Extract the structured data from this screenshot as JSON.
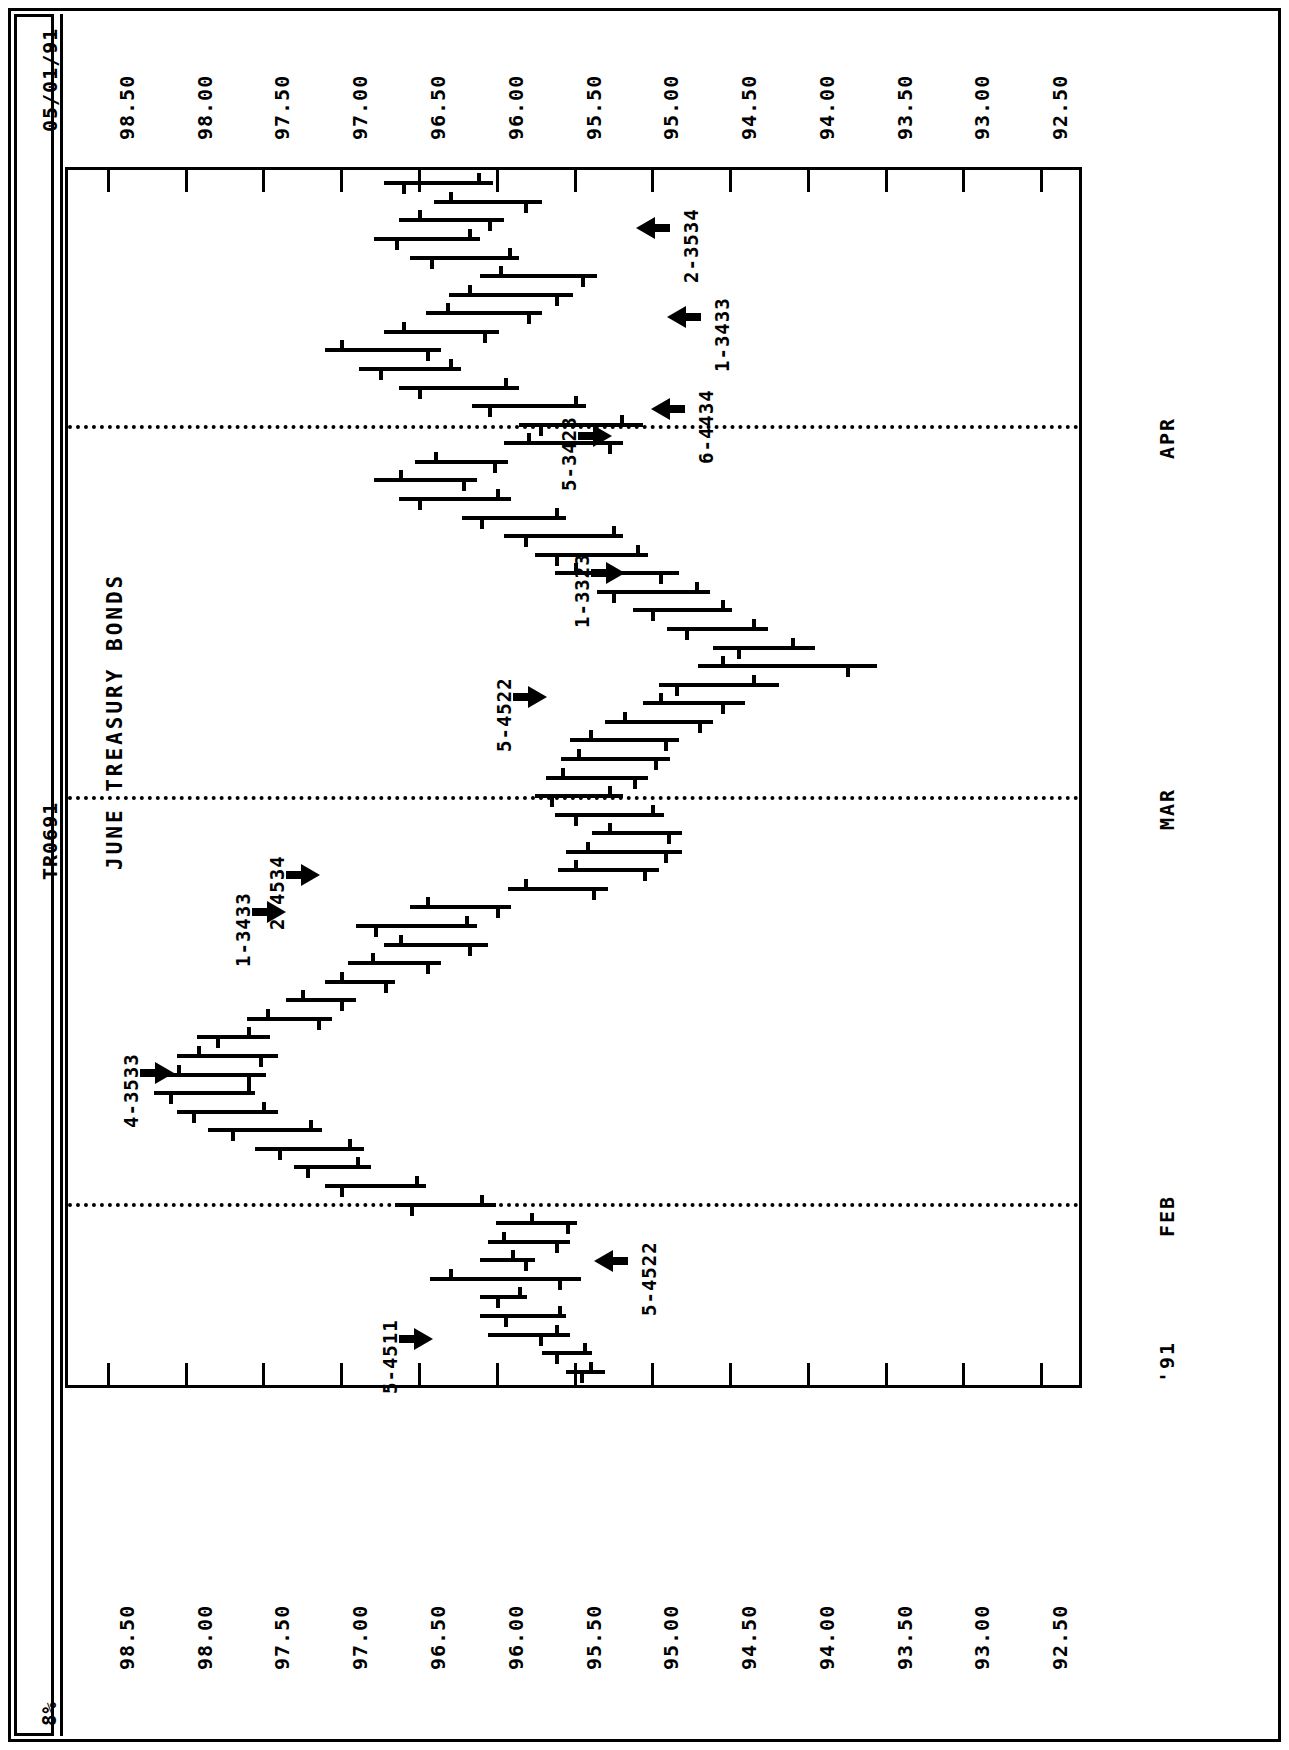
{
  "header": {
    "report_date": "05/01/91",
    "report_id": "TR0691",
    "page_mark": "8%"
  },
  "chart_data": {
    "type": "bar",
    "subtype": "ohlc-bar-chart-rotated",
    "title": "JUNE TREASURY BONDS",
    "xlabel": "",
    "ylabel": "",
    "orientation": "rotated-90-landscape",
    "value_axis": {
      "ticks": [
        "98.50",
        "98.00",
        "97.50",
        "97.00",
        "96.50",
        "96.00",
        "95.50",
        "95.00",
        "94.50",
        "94.00",
        "93.50",
        "93.00",
        "92.50"
      ],
      "min": 92.25,
      "max": 98.75,
      "duplicated_on": [
        "top",
        "bottom"
      ]
    },
    "time_axis": {
      "labels": [
        "'91",
        "FEB",
        "MAR",
        "APR"
      ],
      "label_positions_pct": [
        1.5,
        15.0,
        48.5,
        79.0
      ],
      "grid": "dotted-separators"
    },
    "bars": [
      {
        "i": 0,
        "high": 95.55,
        "low": 95.3,
        "open": 95.4,
        "close": 95.46
      },
      {
        "i": 1,
        "high": 95.7,
        "low": 95.38,
        "open": 95.44,
        "close": 95.62
      },
      {
        "i": 2,
        "high": 96.05,
        "low": 95.52,
        "open": 95.62,
        "close": 95.72
      },
      {
        "i": 3,
        "high": 96.1,
        "low": 95.55,
        "open": 95.6,
        "close": 95.95
      },
      {
        "i": 4,
        "high": 96.1,
        "low": 95.8,
        "open": 95.86,
        "close": 96.0
      },
      {
        "i": 5,
        "high": 96.42,
        "low": 95.45,
        "open": 96.3,
        "close": 95.6
      },
      {
        "i": 6,
        "high": 96.1,
        "low": 95.75,
        "open": 95.9,
        "close": 95.82
      },
      {
        "i": 7,
        "high": 96.05,
        "low": 95.52,
        "open": 95.96,
        "close": 95.62
      },
      {
        "i": 8,
        "high": 96.0,
        "low": 95.48,
        "open": 95.78,
        "close": 95.55
      },
      {
        "i": 9,
        "high": 96.65,
        "low": 96.0,
        "open": 96.1,
        "close": 96.55
      },
      {
        "i": 10,
        "high": 97.1,
        "low": 96.45,
        "open": 96.52,
        "close": 97.0
      },
      {
        "i": 11,
        "high": 97.3,
        "low": 96.8,
        "open": 96.9,
        "close": 97.22
      },
      {
        "i": 12,
        "high": 97.55,
        "low": 96.85,
        "open": 96.95,
        "close": 97.4
      },
      {
        "i": 13,
        "high": 97.85,
        "low": 97.12,
        "open": 97.2,
        "close": 97.7
      },
      {
        "i": 14,
        "high": 98.05,
        "low": 97.4,
        "open": 97.5,
        "close": 97.95
      },
      {
        "i": 15,
        "high": 98.2,
        "low": 97.55,
        "open": 97.6,
        "close": 98.1
      },
      {
        "i": 16,
        "high": 98.2,
        "low": 97.48,
        "open": 98.05,
        "close": 97.6
      },
      {
        "i": 17,
        "high": 98.05,
        "low": 97.4,
        "open": 97.92,
        "close": 97.52
      },
      {
        "i": 18,
        "high": 97.92,
        "low": 97.45,
        "open": 97.6,
        "close": 97.8
      },
      {
        "i": 19,
        "high": 97.6,
        "low": 97.05,
        "open": 97.48,
        "close": 97.15
      },
      {
        "i": 20,
        "high": 97.35,
        "low": 96.9,
        "open": 97.25,
        "close": 97.0
      },
      {
        "i": 21,
        "high": 97.1,
        "low": 96.65,
        "open": 97.0,
        "close": 96.72
      },
      {
        "i": 22,
        "high": 96.95,
        "low": 96.35,
        "open": 96.8,
        "close": 96.45
      },
      {
        "i": 23,
        "high": 96.72,
        "low": 96.05,
        "open": 96.62,
        "close": 96.18
      },
      {
        "i": 24,
        "high": 96.9,
        "low": 96.12,
        "open": 96.2,
        "close": 96.78
      },
      {
        "i": 25,
        "high": 96.55,
        "low": 95.9,
        "open": 96.45,
        "close": 96.0
      },
      {
        "i": 26,
        "high": 95.92,
        "low": 95.28,
        "open": 95.82,
        "close": 95.38
      },
      {
        "i": 27,
        "high": 95.6,
        "low": 94.95,
        "open": 95.5,
        "close": 95.05
      },
      {
        "i": 28,
        "high": 95.55,
        "low": 94.8,
        "open": 95.42,
        "close": 94.92
      },
      {
        "i": 29,
        "high": 95.38,
        "low": 94.8,
        "open": 95.28,
        "close": 94.9
      },
      {
        "i": 30,
        "high": 95.62,
        "low": 94.92,
        "open": 95.0,
        "close": 95.5
      },
      {
        "i": 31,
        "high": 95.75,
        "low": 95.18,
        "open": 95.28,
        "close": 95.65
      },
      {
        "i": 32,
        "high": 95.68,
        "low": 95.02,
        "open": 95.58,
        "close": 95.12
      },
      {
        "i": 33,
        "high": 95.58,
        "low": 94.88,
        "open": 95.48,
        "close": 94.98
      },
      {
        "i": 34,
        "high": 95.52,
        "low": 94.82,
        "open": 95.4,
        "close": 94.92
      },
      {
        "i": 35,
        "high": 95.3,
        "low": 94.6,
        "open": 95.18,
        "close": 94.7
      },
      {
        "i": 36,
        "high": 95.05,
        "low": 94.4,
        "open": 94.95,
        "close": 94.55
      },
      {
        "i": 37,
        "high": 94.95,
        "low": 94.18,
        "open": 94.35,
        "close": 94.85
      },
      {
        "i": 38,
        "high": 94.7,
        "low": 93.55,
        "open": 94.55,
        "close": 93.75
      },
      {
        "i": 39,
        "high": 94.6,
        "low": 93.95,
        "open": 94.1,
        "close": 94.45
      },
      {
        "i": 40,
        "high": 94.9,
        "low": 94.25,
        "open": 94.35,
        "close": 94.78
      },
      {
        "i": 41,
        "high": 95.12,
        "low": 94.48,
        "open": 94.55,
        "close": 95.0
      },
      {
        "i": 42,
        "high": 95.35,
        "low": 94.62,
        "open": 94.72,
        "close": 95.25
      },
      {
        "i": 43,
        "high": 95.62,
        "low": 94.82,
        "open": 95.5,
        "close": 94.95
      },
      {
        "i": 44,
        "high": 95.75,
        "low": 95.02,
        "open": 95.1,
        "close": 95.62
      },
      {
        "i": 45,
        "high": 95.95,
        "low": 95.18,
        "open": 95.25,
        "close": 95.82
      },
      {
        "i": 46,
        "high": 96.22,
        "low": 95.55,
        "open": 95.62,
        "close": 96.1
      },
      {
        "i": 47,
        "high": 96.62,
        "low": 95.9,
        "open": 96.0,
        "close": 96.5
      },
      {
        "i": 48,
        "high": 96.78,
        "low": 96.12,
        "open": 96.62,
        "close": 96.22
      },
      {
        "i": 49,
        "high": 96.52,
        "low": 95.92,
        "open": 96.4,
        "close": 96.02
      },
      {
        "i": 50,
        "high": 95.95,
        "low": 95.18,
        "open": 95.8,
        "close": 95.28
      },
      {
        "i": 51,
        "high": 95.85,
        "low": 95.05,
        "open": 95.2,
        "close": 95.72
      },
      {
        "i": 52,
        "high": 96.15,
        "low": 95.42,
        "open": 95.5,
        "close": 96.05
      },
      {
        "i": 53,
        "high": 96.62,
        "low": 95.85,
        "open": 95.95,
        "close": 96.5
      },
      {
        "i": 54,
        "high": 96.88,
        "low": 96.22,
        "open": 96.3,
        "close": 96.75
      },
      {
        "i": 55,
        "high": 97.1,
        "low": 96.35,
        "open": 97.0,
        "close": 96.45
      },
      {
        "i": 56,
        "high": 96.72,
        "low": 95.98,
        "open": 96.6,
        "close": 96.08
      },
      {
        "i": 57,
        "high": 96.45,
        "low": 95.7,
        "open": 96.32,
        "close": 95.8
      },
      {
        "i": 58,
        "high": 96.3,
        "low": 95.5,
        "open": 96.18,
        "close": 95.62
      },
      {
        "i": 59,
        "high": 96.1,
        "low": 95.35,
        "open": 95.98,
        "close": 95.45
      },
      {
        "i": 60,
        "high": 96.55,
        "low": 95.85,
        "open": 95.92,
        "close": 96.42
      },
      {
        "i": 61,
        "high": 96.78,
        "low": 96.1,
        "open": 96.18,
        "close": 96.65
      },
      {
        "i": 62,
        "high": 96.62,
        "low": 95.95,
        "open": 96.5,
        "close": 96.05
      },
      {
        "i": 63,
        "high": 96.4,
        "low": 95.7,
        "open": 96.3,
        "close": 95.82
      },
      {
        "i": 64,
        "high": 96.72,
        "low": 96.02,
        "open": 96.12,
        "close": 96.6
      }
    ],
    "annotations": [
      {
        "label": "5-4511",
        "arrow": "right",
        "pos_pct": 3.8,
        "value": 96.35
      },
      {
        "label": "5-4522",
        "arrow": "left",
        "pos_pct": 10.2,
        "value": 95.42
      },
      {
        "label": "4-3533",
        "arrow": "right",
        "pos_pct": 25.7,
        "value": 98.02
      },
      {
        "label": "1-3433",
        "arrow": "right",
        "pos_pct": 38.9,
        "value": 97.3
      },
      {
        "label": "2-4534",
        "arrow": "right",
        "pos_pct": 42.0,
        "value": 97.08
      },
      {
        "label": "5-4522",
        "arrow": "right",
        "pos_pct": 56.6,
        "value": 95.62
      },
      {
        "label": "1-3323",
        "arrow": "right",
        "pos_pct": 66.8,
        "value": 95.12
      },
      {
        "label": "5-3423",
        "arrow": "right",
        "pos_pct": 78.1,
        "value": 95.2
      },
      {
        "label": "6-4434",
        "arrow": "left",
        "pos_pct": 80.3,
        "value": 95.05
      },
      {
        "label": "1-3433",
        "arrow": "left",
        "pos_pct": 87.9,
        "value": 94.95
      },
      {
        "label": "2-3534",
        "arrow": "left",
        "pos_pct": 95.2,
        "value": 95.15
      }
    ],
    "month_separators": [
      {
        "label": "FEB",
        "pos_pct": 15.0
      },
      {
        "label": "MAR",
        "pos_pct": 48.5
      },
      {
        "label": "APR",
        "pos_pct": 79.0
      }
    ],
    "year_label": "'91"
  }
}
